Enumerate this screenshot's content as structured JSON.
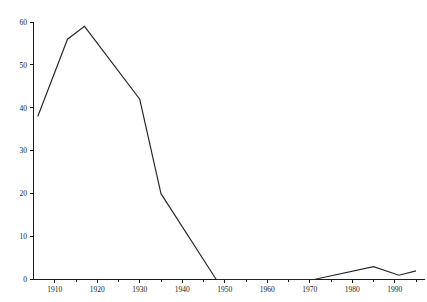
{
  "chart_data": {
    "type": "line",
    "title": "",
    "subtitle": "",
    "xlabel": "",
    "ylabel": "",
    "xlim": [
      1905,
      1997
    ],
    "ylim": [
      0,
      60
    ],
    "grid": false,
    "legend": "none",
    "x_ticks_major": [
      1910,
      1920,
      1930,
      1940,
      1950,
      1960,
      1970,
      1980,
      1990
    ],
    "x_tick_labels": [
      "1910",
      "1920",
      "1930",
      "1940",
      "1950",
      "1960",
      "1970",
      "1980",
      "1990"
    ],
    "x_ticks_minor": [
      1915,
      1925,
      1935,
      1945,
      1955,
      1965,
      1975,
      1985,
      1995
    ],
    "y_ticks": [
      0,
      10,
      20,
      30,
      40,
      50,
      60
    ],
    "y_tick_labels": [
      "0",
      "10",
      "20",
      "30",
      "40",
      "50",
      "60"
    ],
    "series": [
      {
        "name": "series-1",
        "color": "#262626",
        "x": [
          1906,
          1913,
          1917,
          1930,
          1935,
          1948,
          1971,
          1985,
          1991,
          1995
        ],
        "values": [
          38,
          56,
          59,
          42,
          20,
          0,
          0,
          3,
          1,
          2
        ]
      }
    ]
  },
  "axes": {
    "axis_color": "#1a1a1a",
    "background": "#ffffff"
  }
}
